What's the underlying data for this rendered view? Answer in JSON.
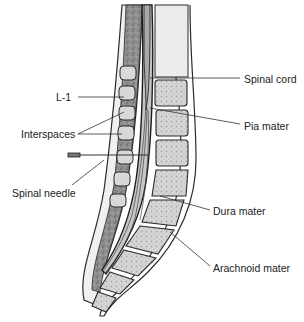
{
  "diagram": {
    "type": "anatomical-illustration",
    "labels": [
      {
        "id": "spinal-cord",
        "text": "Spinal cord",
        "x": 244,
        "y": 73
      },
      {
        "id": "l1",
        "text": "L-1",
        "x": 56,
        "y": 91
      },
      {
        "id": "pia-mater",
        "text": "Pia mater",
        "x": 244,
        "y": 120
      },
      {
        "id": "interspaces",
        "text": "Interspaces",
        "x": 21,
        "y": 128
      },
      {
        "id": "spinal-needle",
        "text": "Spinal needle",
        "x": 12,
        "y": 187
      },
      {
        "id": "dura-mater",
        "text": "Dura mater",
        "x": 213,
        "y": 205
      },
      {
        "id": "arachnoid-mater",
        "text": "Arachnoid mater",
        "x": 213,
        "y": 262
      }
    ],
    "colors": {
      "background": "#ffffff",
      "outline": "#2a2a2a",
      "bone_fill": "#d2d2d2",
      "bone_texture": "#9a9a9a",
      "soft_tissue": "#8c8c8c",
      "cord": "#b8b8b8",
      "skin": "#eeeeee",
      "leader_line": "#333333"
    }
  }
}
